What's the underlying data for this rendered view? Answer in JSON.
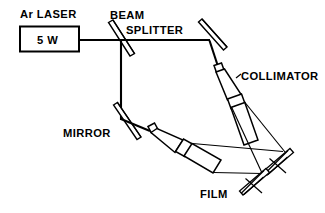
{
  "figure": {
    "type": "optical-setup-diagram",
    "background_color": "#ffffff",
    "line_color": "#000000"
  },
  "labels": {
    "laser_title": "Ar  LASER",
    "laser_power": "5 W",
    "beam_splitter_line1": "BEAM",
    "beam_splitter_line2": "SPLITTER",
    "collimator": "COLLIMATOR",
    "mirror": "MIRROR",
    "film": "FILM"
  },
  "components": [
    {
      "name": "argon-laser-source",
      "label": "Ar  LASER",
      "value": "5 W",
      "shape": "rectangle",
      "x": 20,
      "y": 26,
      "width": 59,
      "height": 25
    },
    {
      "name": "beam-splitter",
      "label": "BEAM SPLITTER",
      "shape": "tilted-plate",
      "center_x": 121,
      "center_y": 40,
      "angle_deg": 45
    },
    {
      "name": "mirror-top-right",
      "label": "MIRROR",
      "shape": "tilted-plate",
      "center_x": 212,
      "center_y": 35,
      "angle_deg": 45
    },
    {
      "name": "mirror-bottom-left",
      "label": "MIRROR",
      "shape": "tilted-plate",
      "center_x": 128,
      "center_y": 122,
      "angle_deg": 45
    },
    {
      "name": "collimator-right",
      "label": "COLLIMATOR",
      "shape": "cone-and-cylinder",
      "angle_deg": 28
    },
    {
      "name": "collimator-left",
      "label": "COLLIMATOR",
      "shape": "cone-and-cylinder",
      "angle_deg": 30
    },
    {
      "name": "film-plate-upper",
      "label": "FILM",
      "shape": "tilted-plate-with-ticks",
      "center_x": 272,
      "center_y": 160
    },
    {
      "name": "film-plate-lower",
      "label": "FILM",
      "shape": "tilted-plate-with-ticks",
      "center_x": 248,
      "center_y": 180
    }
  ],
  "beam_paths": [
    {
      "name": "laser-to-splitter",
      "from": [
        79,
        40
      ],
      "to": [
        121,
        40
      ]
    },
    {
      "name": "splitter-to-mirror-right",
      "from": [
        121,
        40
      ],
      "to": [
        209,
        40
      ]
    },
    {
      "name": "splitter-down-to-mirror-left",
      "from": [
        121,
        40
      ],
      "to": [
        121,
        119
      ]
    },
    {
      "name": "mirror-right-to-collimator",
      "from": [
        210,
        41
      ],
      "to": [
        218,
        68
      ]
    },
    {
      "name": "mirror-left-to-collimator",
      "from": [
        122,
        119
      ],
      "to": [
        150,
        131
      ]
    }
  ]
}
